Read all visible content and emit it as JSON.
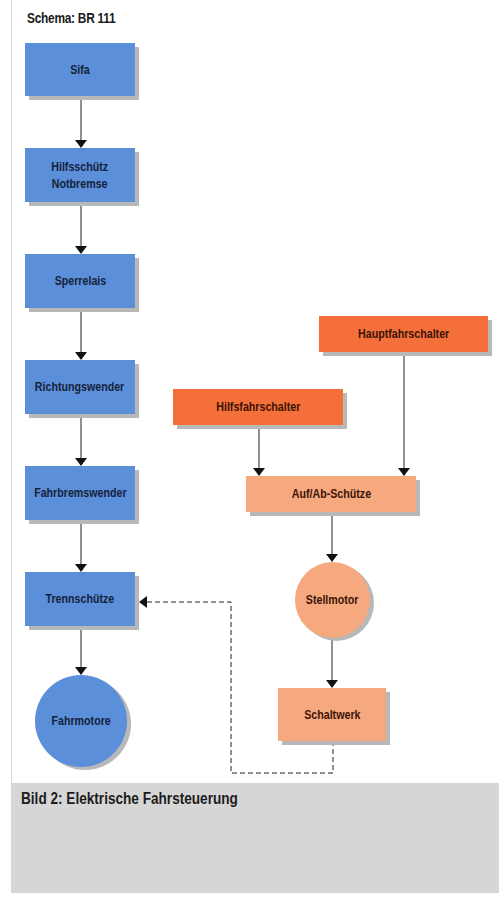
{
  "schema_title": "Schema: BR 111",
  "caption": "Bild 2:  Elektrische Fahrsteuerung",
  "colors": {
    "blue": "#5b8fd9",
    "orange": "#f56f3a",
    "peach": "#f6a87f",
    "caption_bg": "#d6d6d6"
  },
  "left_chain": {
    "sifa": "Sifa",
    "hilfsschuetz_line1": "Hilfsschütz",
    "hilfsschuetz_line2": "Notbremse",
    "sperrelais": "Sperrelais",
    "richtungswender": "Richtungswender",
    "fahrbremswender": "Fahrbremswender",
    "trennschuetze": "Trennschütze",
    "fahrmotore": "Fahrmotore"
  },
  "right_chain": {
    "hauptfahrschalter": "Hauptfahrschalter",
    "hilfsfahrschalter": "Hilfsfahrschalter",
    "auf_ab_schuetze": "Auf/Ab-Schütze",
    "stellmotor": "Stellmotor",
    "schaltwerk": "Schaltwerk"
  },
  "edges": [
    {
      "from": "Sifa",
      "to": "Hilfsschütz Notbremse",
      "style": "solid"
    },
    {
      "from": "Hilfsschütz Notbremse",
      "to": "Sperrelais",
      "style": "solid"
    },
    {
      "from": "Sperrelais",
      "to": "Richtungswender",
      "style": "solid"
    },
    {
      "from": "Richtungswender",
      "to": "Fahrbremswender",
      "style": "solid"
    },
    {
      "from": "Fahrbremswender",
      "to": "Trennschütze",
      "style": "solid"
    },
    {
      "from": "Trennschütze",
      "to": "Fahrmotore",
      "style": "solid"
    },
    {
      "from": "Hilfsfahrschalter",
      "to": "Auf/Ab-Schütze",
      "style": "solid"
    },
    {
      "from": "Hauptfahrschalter",
      "to": "Auf/Ab-Schütze",
      "style": "solid"
    },
    {
      "from": "Auf/Ab-Schütze",
      "to": "Stellmotor",
      "style": "solid"
    },
    {
      "from": "Stellmotor",
      "to": "Schaltwerk",
      "style": "solid"
    },
    {
      "from": "Schaltwerk",
      "to": "Trennschütze",
      "style": "dashed"
    }
  ]
}
